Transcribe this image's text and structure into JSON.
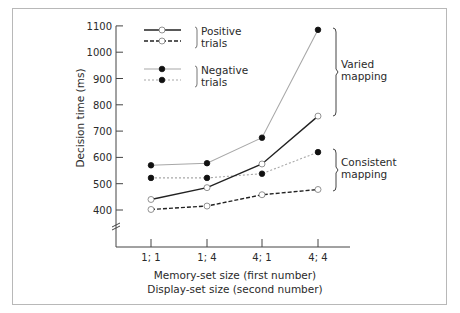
{
  "chart_data": {
    "type": "line",
    "title": "",
    "xlabel_lines": [
      "Memory-set size (first number)",
      "Display-set size (second number)"
    ],
    "ylabel": "Decision time (ms)",
    "categories": [
      "1; 1",
      "1; 4",
      "4; 1",
      "4; 4"
    ],
    "yticks": [
      400,
      500,
      600,
      700,
      800,
      900,
      1000,
      1100
    ],
    "ylim": [
      400,
      1100
    ],
    "y_axis_break": true,
    "grid": false,
    "legend_position": "upper-left",
    "legend_groups": [
      {
        "label_lines": [
          "Positive",
          "trials"
        ],
        "series_indices": [
          0,
          1
        ]
      },
      {
        "label_lines": [
          "Negative",
          "trials"
        ],
        "series_indices": [
          2,
          3
        ]
      }
    ],
    "series": [
      {
        "name": "Positive trials, varied mapping",
        "trial": "positive",
        "mapping": "varied",
        "line_style": "solid",
        "line_color": "#222222",
        "marker": "open-circle",
        "values": [
          440,
          485,
          575,
          757
        ]
      },
      {
        "name": "Positive trials, consistent mapping",
        "trial": "positive",
        "mapping": "consistent",
        "line_style": "dashed",
        "line_color": "#222222",
        "marker": "open-circle",
        "values": [
          402,
          415,
          458,
          478
        ]
      },
      {
        "name": "Negative trials, varied mapping",
        "trial": "negative",
        "mapping": "varied",
        "line_style": "solid",
        "line_color": "#a8a8a8",
        "marker": "filled-circle",
        "values": [
          570,
          578,
          675,
          1085
        ]
      },
      {
        "name": "Negative trials, consistent mapping",
        "trial": "negative",
        "mapping": "consistent",
        "line_style": "dotted",
        "line_color": "#a8a8a8",
        "marker": "filled-circle",
        "values": [
          522,
          522,
          538,
          620
        ]
      }
    ],
    "annotations": [
      {
        "label_lines": [
          "Varied",
          "mapping"
        ],
        "brackets_series": [
          0,
          2
        ]
      },
      {
        "label_lines": [
          "Consistent",
          "mapping"
        ],
        "brackets_series": [
          1,
          3
        ]
      }
    ]
  }
}
